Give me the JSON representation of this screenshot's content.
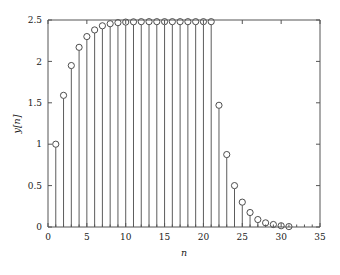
{
  "chart_data": {
    "type": "line",
    "plot_style": "stem",
    "title": "",
    "subtitle": "",
    "xlabel": "n",
    "ylabel": "y[n]",
    "xlim": [
      0,
      35
    ],
    "ylim": [
      0,
      2.5
    ],
    "grid": false,
    "legend": null,
    "legend_position": "none",
    "xticks": [
      0,
      5,
      10,
      15,
      20,
      25,
      30,
      35
    ],
    "xtick_labels": [
      "0",
      "5",
      "10",
      "15",
      "20",
      "25",
      "30",
      "35"
    ],
    "xminor_ticks": [
      1,
      2,
      3,
      4,
      6,
      7,
      8,
      9,
      11,
      12,
      13,
      14,
      16,
      17,
      18,
      19,
      21,
      22,
      23,
      24,
      26,
      27,
      28,
      29,
      31,
      32,
      33,
      34
    ],
    "yticks": [
      0,
      0.5,
      1,
      1.5,
      2,
      2.5
    ],
    "ytick_labels": [
      "0",
      "0.5",
      "1",
      "1.5",
      "2",
      "2.5"
    ],
    "marker": "circle-open",
    "marker_color": "#3a3a3a",
    "stem_color": "#4a4a4a",
    "axis_color": "#555555",
    "background_color": "#ffffff",
    "x": [
      1,
      2,
      3,
      4,
      5,
      6,
      7,
      8,
      9,
      10,
      11,
      12,
      13,
      14,
      15,
      16,
      17,
      18,
      19,
      20,
      21,
      22,
      23,
      24,
      25,
      26,
      27,
      28,
      29,
      30,
      31
    ],
    "values": [
      1.0,
      1.59,
      1.95,
      2.17,
      2.3,
      2.38,
      2.43,
      2.455,
      2.468,
      2.475,
      2.478,
      2.48,
      2.48,
      2.48,
      2.48,
      2.48,
      2.48,
      2.48,
      2.48,
      2.48,
      2.48,
      1.47,
      0.875,
      0.5,
      0.3,
      0.175,
      0.09,
      0.05,
      0.03,
      0.015,
      0.005
    ]
  },
  "axis_labels": {
    "x_title": "n",
    "y_title": "y[n]"
  }
}
